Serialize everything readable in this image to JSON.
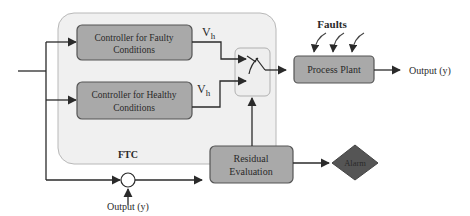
{
  "diagram": {
    "ftc_group": {
      "label": "FTC",
      "fill": "#f0f0f0",
      "stroke": "#b8b8b8"
    },
    "blocks": {
      "faulty_controller": {
        "line1": "Controller for Faulty",
        "line2": "Conditions"
      },
      "healthy_controller": {
        "line1": "Controller for Healthy",
        "line2": "Conditions"
      },
      "process_plant": {
        "label": "Process Plant"
      },
      "residual_evaluation": {
        "line1": "Residual",
        "line2": "Evaluation"
      },
      "alarm": {
        "label": "Alarm"
      }
    },
    "signals": {
      "vh_top": {
        "main": "V",
        "sub": "h"
      },
      "vh_bottom": {
        "main": "V",
        "sub": "h"
      },
      "faults": "Faults",
      "output_right": "Output (y)",
      "output_bottom": "Output (y)"
    },
    "colors": {
      "block_fill": "#a9a9a9",
      "block_stroke": "#555555",
      "alarm_fill": "#555555",
      "line": "#2a2a2a",
      "switch_box_fill": "#eeeeee",
      "switch_box_stroke": "#b0b0b0"
    }
  }
}
